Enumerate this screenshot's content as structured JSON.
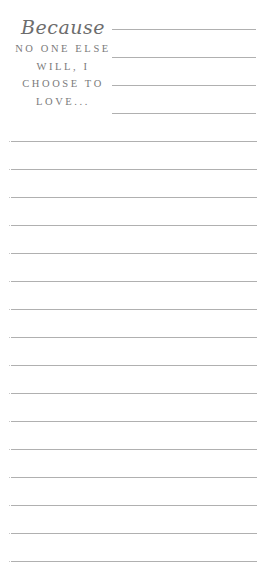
{
  "heading": {
    "script_word": "Because",
    "lines": [
      "NO ONE ELSE",
      "WILL, I",
      "CHOOSE TO",
      "LOVE..."
    ]
  },
  "colors": {
    "text": "#777777",
    "rule": "#b0b0b0",
    "background": "#ffffff"
  },
  "short_rules": {
    "count": 4,
    "x_start": 112,
    "x_end": 256,
    "y": [
      29,
      57,
      85,
      113
    ]
  },
  "full_rules": {
    "count": 16,
    "x_start": 11,
    "x_end": 257,
    "y_start": 141,
    "spacing": 28
  }
}
